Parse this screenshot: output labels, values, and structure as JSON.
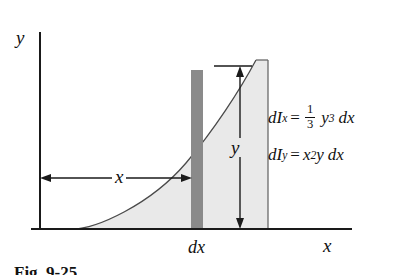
{
  "figure": {
    "caption": "Fig. 9-25",
    "axes": {
      "y_label": "y",
      "x_label": "x"
    },
    "dimensions": {
      "horizontal_label": "x",
      "vertical_label": "y",
      "strip_width_label": "dx"
    },
    "formulas": [
      {
        "id": "dIx",
        "lhs_symbol": "dI",
        "lhs_sub": "x",
        "equals": "=",
        "frac_num": "1",
        "frac_den": "3",
        "var": "y",
        "var_exp": "3",
        "differential": "dx",
        "plain": "dIx = (1/3) y^3 dx"
      },
      {
        "id": "dIy",
        "lhs_symbol": "dI",
        "lhs_sub": "y",
        "equals": "=",
        "var": "x",
        "var_exp": "2",
        "var2": "y",
        "differential": "dx",
        "plain": "dIy = x^2 y dx"
      }
    ],
    "colors": {
      "area_fill": "#e9e9e9",
      "strip_fill": "#8a8a8a",
      "line": "#1a1a1a",
      "background": "#ffffff"
    }
  }
}
